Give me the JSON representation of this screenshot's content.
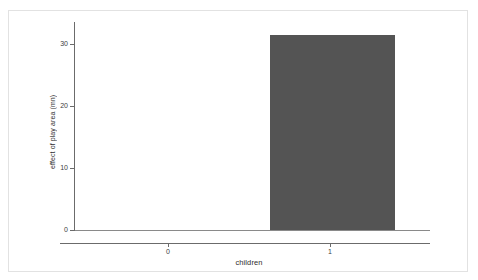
{
  "figure": {
    "background_color": "#ffffff",
    "frame_color": "#e2e2e2",
    "axis_color": "#6b6b6b"
  },
  "chart_data": {
    "type": "bar",
    "title": "",
    "subtitle": "",
    "xlabel": "children",
    "ylabel": "effect of play area (mn)",
    "categories": [
      "0",
      "1"
    ],
    "values": [
      0,
      30.5
    ],
    "series": [
      {
        "name": "effect of play area",
        "values": [
          0,
          30.5
        ],
        "color": "#545454"
      }
    ],
    "ylim": [
      0,
      32.5
    ],
    "yticks": [
      0,
      10,
      20,
      30
    ],
    "ytick_labels": [
      "0",
      "10",
      "20",
      "30"
    ],
    "xtick_labels": [
      "0",
      "1"
    ],
    "grid": false,
    "legend": false,
    "legend_position": "none",
    "annotations": []
  },
  "axes": {
    "y_tick_labels": [
      {
        "value": "30"
      },
      {
        "value": "20"
      },
      {
        "value": "10"
      },
      {
        "value": "0"
      }
    ],
    "x_tick_labels": [
      {
        "value": "0"
      },
      {
        "value": "1"
      }
    ],
    "y_title": "effect of play area (mn)",
    "x_title": "children"
  }
}
